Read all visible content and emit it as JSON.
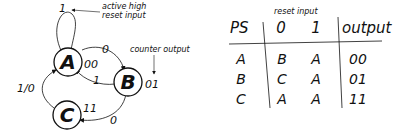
{
  "diagram": {
    "states": [
      {
        "name": "A",
        "output": "00"
      },
      {
        "name": "B",
        "output": "01"
      },
      {
        "name": "C",
        "output": "11"
      }
    ],
    "transitions": {
      "a_self": "1",
      "a_to_b": "0",
      "b_to_a": "1",
      "b_to_c": "0",
      "c_to_a": "1/0"
    },
    "annotations": {
      "reset_line1": "active high",
      "reset_line2": "reset input",
      "counter": "counter output"
    }
  },
  "table": {
    "caption": "reset input",
    "headers": [
      "PS",
      "0",
      "1",
      "output"
    ],
    "rows": [
      [
        "A",
        "B",
        "A",
        "00"
      ],
      [
        "B",
        "C",
        "A",
        "01"
      ],
      [
        "C",
        "A",
        "A",
        "11"
      ]
    ]
  }
}
